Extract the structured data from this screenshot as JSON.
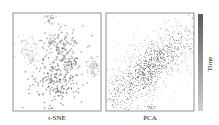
{
  "chart_data": [
    {
      "type": "scatter",
      "title": "t-SNE",
      "xlabel": "t-SNE",
      "ylabel": "",
      "description": "t-SNE embedding colored by time; light (early) clusters on left/right edges, dark (late) clusters in center",
      "clusters": [
        {
          "cx": 0.55,
          "cy": 0.33,
          "sx": 0.12,
          "sy": 0.09,
          "t": 0.75,
          "n": 120
        },
        {
          "cx": 0.47,
          "cy": 0.68,
          "sx": 0.14,
          "sy": 0.14,
          "t": 0.9,
          "n": 220
        },
        {
          "cx": 0.42,
          "cy": 0.06,
          "sx": 0.03,
          "sy": 0.03,
          "t": 0.4,
          "n": 25
        },
        {
          "cx": 0.15,
          "cy": 0.35,
          "sx": 0.07,
          "sy": 0.06,
          "t": 0.15,
          "n": 50
        },
        {
          "cx": 0.22,
          "cy": 0.48,
          "sx": 0.05,
          "sy": 0.04,
          "t": 0.1,
          "n": 30
        },
        {
          "cx": 0.9,
          "cy": 0.55,
          "sx": 0.05,
          "sy": 0.05,
          "t": 0.35,
          "n": 45
        },
        {
          "cx": 0.65,
          "cy": 0.5,
          "sx": 0.05,
          "sy": 0.04,
          "t": 0.7,
          "n": 30
        }
      ]
    },
    {
      "type": "scatter",
      "title": "PCA",
      "xlabel": "PCA",
      "ylabel": "",
      "description": "PCA projection: dense elongated diagonal cloud from lower-left to upper-right, darker in center; small blob at bottom",
      "clusters": [
        {
          "cx": 0.5,
          "cy": 0.55,
          "major": 0.32,
          "minor": 0.1,
          "angle": -38,
          "t": 0.65,
          "n": 900
        },
        {
          "cx": 0.5,
          "cy": 0.5,
          "major": 0.5,
          "minor": 0.25,
          "angle": -38,
          "t": 0.15,
          "n": 250
        },
        {
          "cx": 0.5,
          "cy": 0.96,
          "major": 0.03,
          "minor": 0.015,
          "angle": 0,
          "t": 0.6,
          "n": 25
        }
      ]
    }
  ],
  "colorbar": {
    "label": "Time",
    "colors": [
      "#6a6a6a",
      "#bdbdbd"
    ]
  },
  "labels": {
    "tsne": "t-SNE",
    "pca": "PCA",
    "colorbar": "Time"
  }
}
